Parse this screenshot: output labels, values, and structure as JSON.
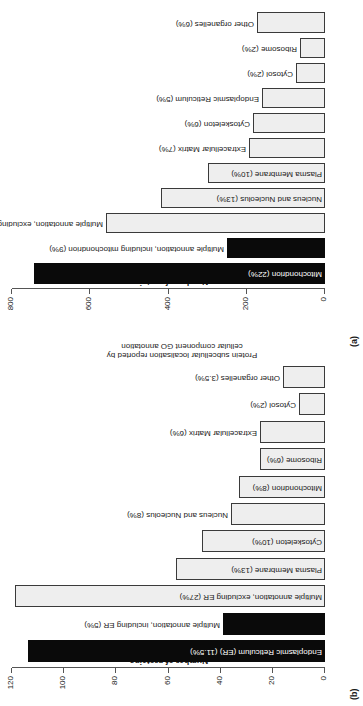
{
  "figure": {
    "axis_title": "Number of proteins",
    "side_caption_line1": "Protein subcellular localisation reported by",
    "side_caption_line2": "cellular component GO annotation"
  },
  "panel_a": {
    "tag": "(a)",
    "chart_data": {
      "type": "bar",
      "title": "",
      "xlabel": "Protein subcellular localisation reported by cellular component GO annotation",
      "ylabel": "Number of proteins",
      "ylim": [
        0,
        800
      ],
      "yticks": [
        0,
        200,
        400,
        600,
        800
      ],
      "grid": false,
      "legend": "none",
      "orientation": "horizontal",
      "categories": [
        "Mitochondrion (22%)",
        "Multiple annotation, including mitochondrion (9%)",
        "Multiple annotation, excluding mitochondrion (18%)",
        "Nucleus and Nucleolus (13%)",
        "Plasma Membrane (10%)",
        "Extracellular Matrix (7%)",
        "Cytoskeleton (6%)",
        "Endoplasmic Reticulum (5%)",
        "Cytosol (2%)",
        "Ribosome (2%)",
        "Other organelles (6%)"
      ],
      "values": [
        745,
        250,
        560,
        420,
        300,
        195,
        185,
        160,
        75,
        65,
        175
      ],
      "bar_colors": [
        "#0a0a0a",
        "#0a0a0a",
        "#eeeeee",
        "#eeeeee",
        "#eeeeee",
        "#eeeeee",
        "#eeeeee",
        "#eeeeee",
        "#eeeeee",
        "#eeeeee",
        "#eeeeee"
      ]
    }
  },
  "panel_b": {
    "tag": "(b)",
    "chart_data": {
      "type": "bar",
      "title": "",
      "xlabel": "",
      "ylabel": "Number of proteins",
      "ylim": [
        0,
        120
      ],
      "yticks": [
        0,
        20,
        40,
        60,
        80,
        100,
        120
      ],
      "grid": false,
      "legend": "none",
      "orientation": "horizontal",
      "categories": [
        "Endoplasmic Reticulum (ER) (11.5%)",
        "Multiple annotation, including ER (5%)",
        "Multiple annotation, excluding ER (27%)",
        "Plasma Membrane (13%)",
        "Cytoskeleton (10%)",
        "Nucleus and Nucleolus (8%)",
        "Mitochondrion (8%)",
        "Ribosome (6%)",
        "Extracellular Matrix (6%)",
        "Cytosol (2%)",
        "Other organelles (3.5%)"
      ],
      "values": [
        114,
        39,
        119,
        57,
        47,
        36,
        33,
        25,
        25,
        10,
        16
      ],
      "bar_colors": [
        "#0a0a0a",
        "#0a0a0a",
        "#eeeeee",
        "#eeeeee",
        "#eeeeee",
        "#eeeeee",
        "#eeeeee",
        "#eeeeee",
        "#eeeeee",
        "#eeeeee",
        "#eeeeee"
      ]
    }
  },
  "colors": {
    "filled_bar": "#0a0a0a",
    "open_bar_fill": "#eeeeee",
    "bar_stroke": "#3a3a3a",
    "axis": "#555555",
    "text": "#1a1a1a",
    "background": "#ffffff"
  }
}
